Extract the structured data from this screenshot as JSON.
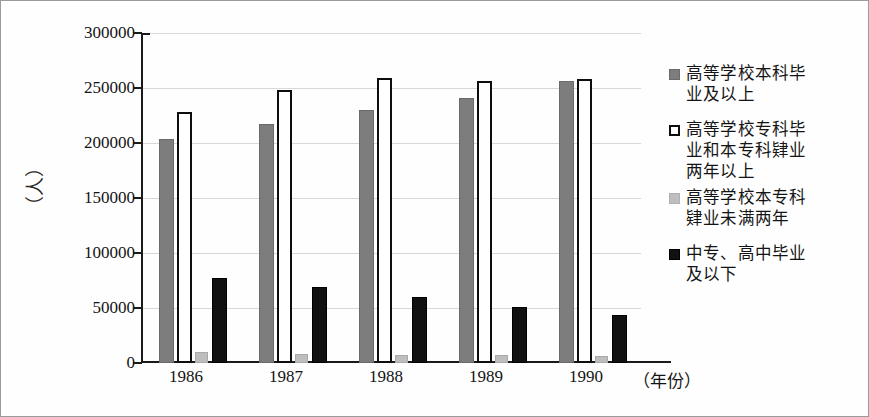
{
  "chart_data": {
    "type": "bar",
    "title": "",
    "subtitle": "",
    "xlabel": "（年份）",
    "ylabel": "（人）",
    "categories": [
      "1986",
      "1987",
      "1988",
      "1989",
      "1990"
    ],
    "ylim": [
      0,
      300000
    ],
    "yticks": [
      0,
      50000,
      100000,
      150000,
      200000,
      250000,
      300000
    ],
    "ytick_labels": [
      "0",
      "50000",
      "100000",
      "150000",
      "200000",
      "250000",
      "300000"
    ],
    "grid": true,
    "grid_axis": "y",
    "legend_position": "right",
    "series": [
      {
        "name": "高等学校本科毕业及以上",
        "color": "#7d7d7d",
        "values": [
          204000,
          217000,
          230000,
          241000,
          256000
        ]
      },
      {
        "name": "高等学校专科毕业和本专科肄业两年以上",
        "color": "#ffffff",
        "values": [
          228000,
          248000,
          259000,
          256000,
          258000
        ]
      },
      {
        "name": "高等学校本专科肄业未满两年",
        "color": "#bebebe",
        "values": [
          10000,
          8000,
          7000,
          7000,
          6000
        ]
      },
      {
        "name": "中专、高中毕业及以下",
        "color": "#111111",
        "values": [
          77000,
          69000,
          60000,
          51000,
          44000
        ]
      }
    ]
  },
  "legend": {
    "items": [
      {
        "swatch": "s0",
        "lines": [
          "高等学校本科毕",
          "业及以上"
        ]
      },
      {
        "swatch": "s1",
        "lines": [
          "高等学校专科毕",
          "业和本专科肄业",
          "两年以上"
        ]
      },
      {
        "swatch": "s2",
        "lines": [
          "高等学校本专科",
          "肄业未满两年"
        ]
      },
      {
        "swatch": "s3",
        "lines": [
          "中专、高中毕业",
          "及以下"
        ]
      }
    ]
  },
  "axis": {
    "y_unit": "（人）",
    "x_unit": "（年份）"
  },
  "colors": {
    "series_1": "#7d7d7d",
    "series_2": "#ffffff",
    "series_3": "#bebebe",
    "series_4": "#111111",
    "axis": "#1a1a1a",
    "grid": "#d8d8d8",
    "border": "#9a9a9a",
    "background": "#fefefe"
  }
}
